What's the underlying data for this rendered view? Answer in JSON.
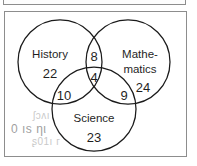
{
  "figure": {
    "kind": "three-set-venn-diagram",
    "sets": [
      {
        "id": "history",
        "label": "History",
        "only_count": "22"
      },
      {
        "id": "mathematics",
        "label_line1": "Mathe-",
        "label_line2": "matics",
        "only_count": "24"
      },
      {
        "id": "science",
        "label": "Science",
        "only_count": "23"
      }
    ],
    "regions": [
      {
        "id": "history-only",
        "label": "History only",
        "value": "22"
      },
      {
        "id": "mathematics-only",
        "label": "Mathematics only",
        "value": "24"
      },
      {
        "id": "science-only",
        "label": "Science only",
        "value": "23"
      },
      {
        "id": "history-mathematics",
        "label": "History and Mathematics only",
        "value": "8"
      },
      {
        "id": "history-science",
        "label": "History and Science only",
        "value": "10"
      },
      {
        "id": "mathematics-science",
        "label": "Mathematics and Science only",
        "value": "9"
      },
      {
        "id": "history-mathematics-science",
        "label": "All three subjects",
        "value": "4"
      }
    ],
    "colors": {
      "circle_stroke": "#1a1a1a",
      "box_border": "#8d8d8d",
      "text": "#1f1f1f",
      "ghost_text": "#c9c9c9",
      "background": "#ffffff"
    }
  },
  "artifacts": {
    "ghost_line_1": "ʃɔʌı",
    "ghost_line_2": "0 ıs ƞι",
    "ghost_line_3": "ʂ01ı г"
  }
}
